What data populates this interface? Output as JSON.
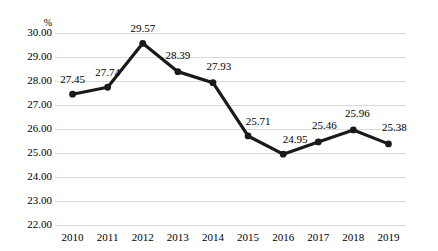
{
  "chart_data": {
    "type": "line",
    "title": "",
    "subtitle": "",
    "xlabel": "",
    "ylabel": "%",
    "axis_unit_label": "%",
    "categories": [
      "2010",
      "2011",
      "2012",
      "2013",
      "2014",
      "2015",
      "2016",
      "2017",
      "2018",
      "2019"
    ],
    "values": [
      27.45,
      27.74,
      29.57,
      28.39,
      27.93,
      25.71,
      24.95,
      25.46,
      25.96,
      25.38
    ],
    "point_labels": [
      "27.45",
      "27.74",
      "29.57",
      "28.39",
      "27.93",
      "25.71",
      "24.95",
      "25.46",
      "25.96",
      "25.38"
    ],
    "ylim": [
      22.0,
      30.0
    ],
    "ytick_step": 1.0,
    "ytick_labels": [
      "30.00",
      "29.00",
      "28.00",
      "27.00",
      "26.00",
      "25.00",
      "24.00",
      "23.00",
      "22.00"
    ],
    "ytick_values": [
      30.0,
      29.0,
      28.0,
      27.0,
      26.0,
      25.0,
      24.0,
      23.0,
      22.0
    ],
    "xtick_labels": [
      "2010",
      "2011",
      "2012",
      "2013",
      "2014",
      "2015",
      "2016",
      "2017",
      "2018",
      "2019"
    ],
    "grid": "horizontal",
    "legend": "none",
    "series_color": "#1a1a1a",
    "grid_color": "#d9d9d9",
    "background_color": "#ffffff",
    "marker": "circle",
    "label_offsets": [
      {
        "dx": 0,
        "dy": -20
      },
      {
        "dx": 0,
        "dy": -20
      },
      {
        "dx": 0,
        "dy": -20
      },
      {
        "dx": 0,
        "dy": -22
      },
      {
        "dx": 6,
        "dy": -22
      },
      {
        "dx": 10,
        "dy": -20
      },
      {
        "dx": 12,
        "dy": -20
      },
      {
        "dx": 6,
        "dy": -22
      },
      {
        "dx": 4,
        "dy": -22
      },
      {
        "dx": 6,
        "dy": -22
      }
    ]
  }
}
